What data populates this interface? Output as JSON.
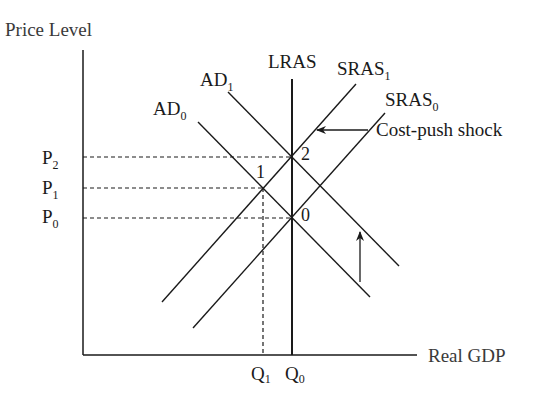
{
  "diagram": {
    "y_axis_label": "Price Level",
    "x_axis_label": "Real GDP",
    "price_levels": [
      {
        "main": "P",
        "sub": "2"
      },
      {
        "main": "P",
        "sub": "1"
      },
      {
        "main": "P",
        "sub": "0"
      }
    ],
    "quantities": [
      {
        "main": "Q",
        "sub": "1"
      },
      {
        "main": "Q",
        "sub": "0"
      }
    ],
    "curves": {
      "lras": "LRAS",
      "ad1": {
        "main": "AD",
        "sub": "1"
      },
      "ad0": {
        "main": "AD",
        "sub": "0"
      },
      "sras1": {
        "main": "SRAS",
        "sub": "1"
      },
      "sras0": {
        "main": "SRAS",
        "sub": "0"
      }
    },
    "points": {
      "p0": "0",
      "p1": "1",
      "p2": "2"
    },
    "annotation": "Cost-push shock",
    "colors": {
      "line": "#1a1a1a",
      "background": "#ffffff"
    }
  }
}
